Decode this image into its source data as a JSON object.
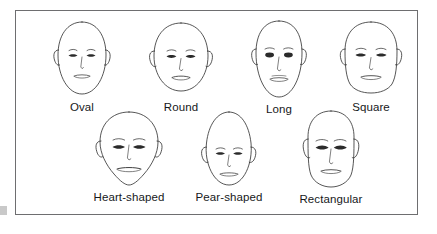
{
  "figure": {
    "border_color": "#6e6e70",
    "background_color": "#ffffff",
    "line_color": "#2b2b2b",
    "label_color": "#16181a"
  },
  "rows": [
    {
      "row_index": 1,
      "faces": [
        {
          "id": "oval",
          "label": "Oval",
          "shape": "oval"
        },
        {
          "id": "round",
          "label": "Round",
          "shape": "round"
        },
        {
          "id": "long",
          "label": "Long",
          "shape": "long"
        },
        {
          "id": "square",
          "label": "Square",
          "shape": "square"
        }
      ]
    },
    {
      "row_index": 2,
      "faces": [
        {
          "id": "heart",
          "label": "Heart-shaped",
          "shape": "heart"
        },
        {
          "id": "pear",
          "label": "Pear-shaped",
          "shape": "pear"
        },
        {
          "id": "rectangular",
          "label": "Rectangular",
          "shape": "rectangular"
        }
      ]
    }
  ]
}
